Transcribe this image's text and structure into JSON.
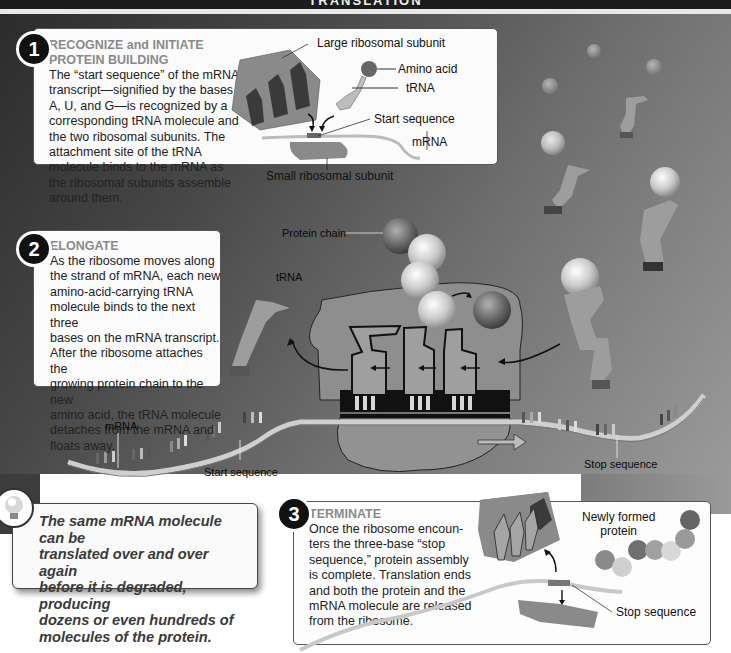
{
  "title": "TRANSLATION",
  "steps": [
    {
      "number": "1",
      "heading_line1": "RECOGNIZE and INITIATE",
      "heading_line2": "PROTEIN BUILDING",
      "body_lines": [
        "The “start sequence” of the mRNA",
        "transcript—signified by the bases",
        "A, U, and G—is recognized by a",
        "corresponding tRNA molecule and",
        "the two ribosomal subunits. The",
        "attachment site of the tRNA",
        "molecule binds to the mRNA as",
        "the ribosomal subunits assemble",
        "around them."
      ],
      "labels": {
        "large_subunit": "Large ribosomal subunit",
        "amino_acid": "Amino acid",
        "trna": "tRNA",
        "start_sequence": "Start sequence",
        "mrna": "mRNA",
        "small_subunit": "Small ribosomal subunit"
      }
    },
    {
      "number": "2",
      "heading_line1": "ELONGATE",
      "body_lines": [
        "As the ribosome moves along",
        "the strand of mRNA, each new",
        "amino-acid-carrying tRNA",
        "molecule binds to the next three",
        "bases on the mRNA transcript.",
        "After the ribosome attaches the",
        "growing protein chain to the new",
        "amino acid, the tRNA molecule",
        "detaches from the mRNA and",
        "floats away."
      ],
      "labels": {
        "protein_chain": "Protein chain",
        "trna": "tRNA",
        "mrna": "mRNA",
        "start_sequence": "Start sequence",
        "stop_sequence": "Stop sequence"
      }
    },
    {
      "number": "3",
      "heading_line1": "TERMINATE",
      "body_lines": [
        "Once the ribosome encoun-",
        "ters the three-base “stop",
        "sequence,” protein assembly",
        "is complete. Translation ends",
        "and both the protein and the",
        "mRNA molecule are released",
        "from the ribosome."
      ],
      "labels": {
        "newly_formed_protein_line1": "Newly formed",
        "newly_formed_protein_line2": "protein",
        "stop_sequence": "Stop sequence"
      }
    }
  ],
  "tip": {
    "icon": "lightbulb-icon",
    "lines": [
      "The same mRNA molecule can be",
      "translated over and over again",
      "before it is degraded, producing",
      "dozens or even hundreds of",
      "molecules of the protein."
    ]
  },
  "colors": {
    "background_dark": "#2c2c2c",
    "background_light": "#9a9a9a",
    "panel": "#fbfbfb",
    "heading_gray": "#8a8a8a",
    "ribosome": "#8c8c8c",
    "trna": "#a5a5a5",
    "mrna": "#c8c8c8"
  }
}
